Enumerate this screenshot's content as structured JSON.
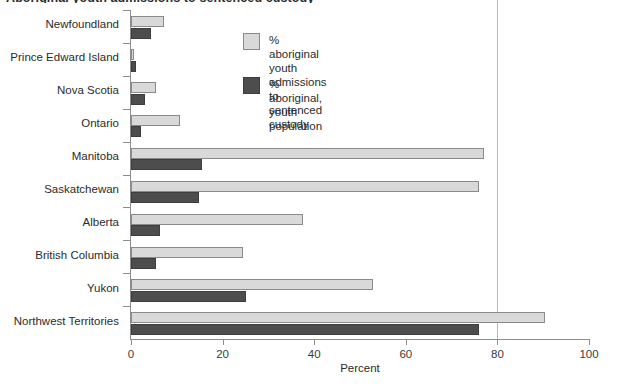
{
  "chart_data": {
    "type": "bar",
    "orientation": "horizontal",
    "title": "Aboriginal youth admissions to sentenced custody",
    "xlabel": "Percent",
    "ylabel": "",
    "xlim": [
      0,
      100
    ],
    "xticks": [
      0,
      20,
      40,
      60,
      80,
      100
    ],
    "xtick_labels": [
      "0",
      "20",
      "40",
      "60",
      "80",
      "100"
    ],
    "grid": false,
    "reference_line": 80,
    "legend_position": "upper right",
    "categories": [
      "Newfoundland",
      "Prince Edward Island",
      "Nova Scotia",
      "Ontario",
      "Manitoba",
      "Saskatchewan",
      "Alberta",
      "British Columbia",
      "Yukon",
      "Northwest Territories"
    ],
    "series": [
      {
        "name": "% aboriginal youth admissions\nto sentenced custody",
        "color": "#d9d9d9",
        "values": [
          7.2,
          0.7,
          5.5,
          10.7,
          77.0,
          76.0,
          37.5,
          24.5,
          52.8,
          90.4
        ]
      },
      {
        "name": "% aboriginal, youth population",
        "color": "#4d4d4d",
        "values": [
          4.4,
          1.1,
          3.0,
          2.2,
          15.6,
          14.8,
          6.3,
          5.5,
          25.0,
          76.0
        ]
      }
    ]
  },
  "legend": {
    "items": [
      {
        "label": "% aboriginal youth admissions\nto sentenced custody",
        "swatch": "light"
      },
      {
        "label": "% aboriginal, youth population",
        "swatch": "dark"
      }
    ]
  },
  "axis": {
    "x_title": "Percent"
  }
}
